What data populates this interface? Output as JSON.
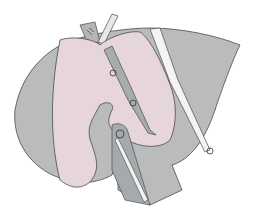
{
  "image": {
    "description": "Surgical illustration of liver with pink parenchyma, gray lobes, ligated vessels and a white drain/duct",
    "colors": {
      "background": "#ffffff",
      "gray_lobe": "#b9bbbd",
      "gray_dark": "#a7aaac",
      "pink_parenchyma": "#e6d6db",
      "white_duct": "#f2f2f2",
      "outline": "#4a4a4a"
    },
    "labels": []
  }
}
